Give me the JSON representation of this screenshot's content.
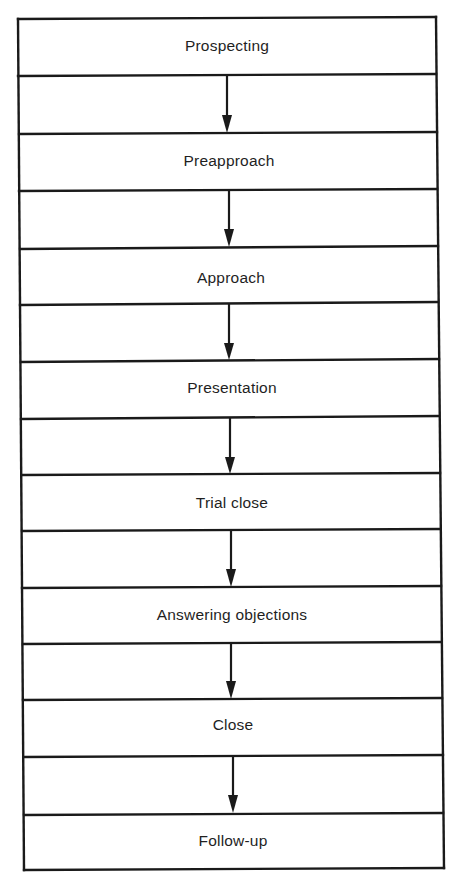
{
  "diagram": {
    "type": "vertical-process-flow",
    "steps": [
      {
        "label": "Prospecting"
      },
      {
        "label": "Preapproach"
      },
      {
        "label": "Approach"
      },
      {
        "label": "Presentation"
      },
      {
        "label": "Trial close"
      },
      {
        "label": "Answering objections"
      },
      {
        "label": "Close"
      },
      {
        "label": "Follow-up"
      }
    ],
    "connectors": [
      {
        "from": "Prospecting",
        "to": "Preapproach"
      },
      {
        "from": "Preapproach",
        "to": "Approach"
      },
      {
        "from": "Approach",
        "to": "Presentation"
      },
      {
        "from": "Presentation",
        "to": "Trial close"
      },
      {
        "from": "Trial close",
        "to": "Answering objections"
      },
      {
        "from": "Answering objections",
        "to": "Close"
      },
      {
        "from": "Close",
        "to": "Follow-up"
      }
    ],
    "colors": {
      "line": "#1a1a1a",
      "text": "#1f1f1f",
      "background": "#ffffff"
    }
  }
}
